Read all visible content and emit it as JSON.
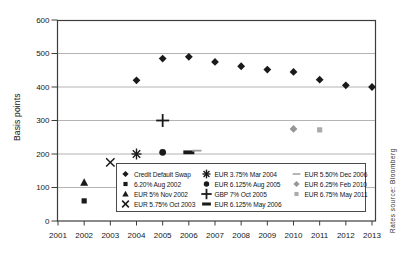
{
  "chart_data": {
    "type": "scatter",
    "title": "",
    "xlabel": "",
    "ylabel": "Basis points",
    "xlim": [
      2001,
      2013
    ],
    "ylim": [
      0,
      600
    ],
    "xticks": [
      2001,
      2002,
      2003,
      2004,
      2005,
      2006,
      2007,
      2008,
      2009,
      2010,
      2011,
      2012,
      2013
    ],
    "yticks": [
      0,
      100,
      200,
      300,
      400,
      500,
      600
    ],
    "grid": "horizontal",
    "legend_position": "inside-bottom-right",
    "source_note": "Rates source: Bloomberg",
    "colors": {
      "black_marker": "#1a1a1a",
      "gray_marker": "#999999",
      "gridline": "#b4b4b4",
      "axis": "#3c3c3c"
    },
    "series": [
      {
        "name": "Credit Default Swap",
        "marker": "diamond",
        "color": "#1a1a1a",
        "points": [
          [
            2004,
            420
          ],
          [
            2005,
            485
          ],
          [
            2006,
            490
          ],
          [
            2007,
            475
          ],
          [
            2008,
            462
          ],
          [
            2009,
            452
          ],
          [
            2010,
            445
          ],
          [
            2011,
            422
          ],
          [
            2012,
            405
          ],
          [
            2013,
            400
          ]
        ]
      },
      {
        "name": "6.20% Aug 2002",
        "marker": "square",
        "color": "#1a1a1a",
        "points": [
          [
            2002,
            60
          ]
        ]
      },
      {
        "name": "EUR 5% Nov 2002",
        "marker": "triangle",
        "color": "#1a1a1a",
        "points": [
          [
            2002,
            115
          ]
        ]
      },
      {
        "name": "EUR 5.75% Oct 2003",
        "marker": "x",
        "color": "#1a1a1a",
        "points": [
          [
            2003,
            175
          ]
        ]
      },
      {
        "name": "EUR 3.75% Mar 2004",
        "marker": "asterisk",
        "color": "#1a1a1a",
        "points": [
          [
            2004,
            200
          ]
        ]
      },
      {
        "name": "EUR 6.125% Aug 2005",
        "marker": "circle",
        "color": "#1a1a1a",
        "points": [
          [
            2005,
            205
          ]
        ]
      },
      {
        "name": "GBP 7% Oct 2005",
        "marker": "plus",
        "color": "#1a1a1a",
        "points": [
          [
            2005,
            300
          ]
        ]
      },
      {
        "name": "EUR 6.125% May 2006",
        "marker": "thick-dash",
        "color": "#1a1a1a",
        "points": [
          [
            2006,
            205
          ]
        ]
      },
      {
        "name": "EUR 5.50% Dec 2006",
        "marker": "dash",
        "color": "#9c9c9c",
        "points": [
          [
            2006.3,
            210
          ]
        ]
      },
      {
        "name": "EUR 6.25% Feb 2010",
        "marker": "diamond",
        "color": "#969696",
        "points": [
          [
            2010,
            275
          ]
        ]
      },
      {
        "name": "EUR 6.75% May 2011",
        "marker": "square",
        "color": "#ababab",
        "points": [
          [
            2011,
            272
          ]
        ]
      }
    ],
    "legend_columns": [
      [
        0,
        1,
        2,
        3
      ],
      [
        4,
        5,
        6,
        7
      ],
      [
        8,
        9,
        10
      ]
    ]
  }
}
